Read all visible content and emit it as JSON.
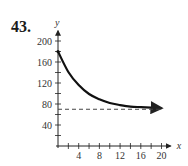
{
  "problem": {
    "number": "43."
  },
  "chart_data": {
    "type": "line",
    "title": "",
    "xlabel": "x",
    "ylabel": "y",
    "xlim": [
      0,
      21
    ],
    "ylim": [
      0,
      210
    ],
    "x_ticks": [
      4,
      8,
      12,
      16,
      20
    ],
    "x_minor_ticks": [
      2,
      4,
      6,
      8,
      10,
      12,
      14,
      16,
      18,
      20
    ],
    "y_ticks": [
      40,
      80,
      120,
      160,
      200
    ],
    "y_minor_ticks": [
      20,
      40,
      60,
      80,
      100,
      120,
      140,
      160,
      180,
      200
    ],
    "grid": false,
    "legend": null,
    "series": [
      {
        "name": "curve",
        "style": "solid",
        "x": [
          0,
          2,
          4,
          6,
          8,
          10,
          12,
          14,
          16,
          18,
          20
        ],
        "y": [
          180,
          141,
          116,
          99,
          89,
          82,
          78,
          75,
          74,
          73,
          72
        ]
      },
      {
        "name": "horizontal asymptote",
        "style": "dashed",
        "x": [
          0,
          20
        ],
        "y": [
          70,
          70
        ]
      }
    ]
  }
}
